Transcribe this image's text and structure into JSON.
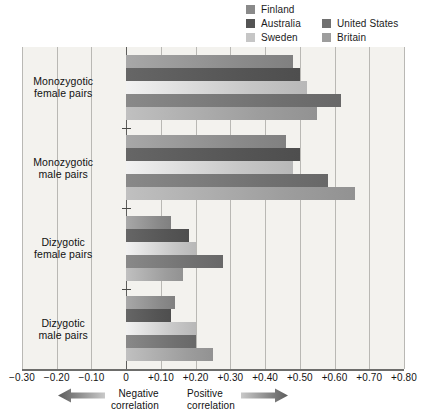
{
  "legend": {
    "columns": [
      [
        {
          "label": "Finland",
          "swatch": "#8a8a8a"
        },
        {
          "label": "Australia",
          "swatch": "#545454"
        },
        {
          "label": "Sweden",
          "swatch": "#c6c6c6"
        }
      ],
      [
        {
          "label": "United States",
          "swatch": "#707070"
        },
        {
          "label": "Britain",
          "swatch": "#9d9d9d"
        }
      ]
    ]
  },
  "axis": {
    "ticks": [
      {
        "label": "−0.30",
        "value": -0.3
      },
      {
        "label": "−0.20",
        "value": -0.2
      },
      {
        "label": "−0.10",
        "value": -0.1
      },
      {
        "label": "0",
        "value": 0.0
      },
      {
        "label": "+0.10",
        "value": 0.1
      },
      {
        "label": "+0.20",
        "value": 0.2
      },
      {
        "label": "+0.30",
        "value": 0.3
      },
      {
        "label": "+0.40",
        "value": 0.4
      },
      {
        "label": "+0.50",
        "value": 0.5
      },
      {
        "label": "+0.60",
        "value": 0.6
      },
      {
        "label": "+0.70",
        "value": 0.7
      },
      {
        "label": "+0.80",
        "value": 0.8
      }
    ],
    "min": -0.3,
    "max": 0.8
  },
  "captions": {
    "negative": {
      "line1": "Negative",
      "line2": "correlation",
      "arrow": "arrow-left-icon"
    },
    "positive": {
      "line1": "Positive",
      "line2": "correlation",
      "arrow": "arrow-right-icon"
    }
  },
  "chart_data": {
    "type": "bar",
    "orientation": "horizontal",
    "title": "",
    "xlabel": "",
    "ylabel": "",
    "xlim": [
      -0.3,
      0.8
    ],
    "grid": true,
    "legend_position": "top-right",
    "categories": [
      "Monozygotic female pairs",
      "Monozygotic male pairs",
      "Dizygotic female pairs",
      "Dizygotic male pairs"
    ],
    "series": [
      {
        "name": "Finland",
        "color": "#8a8a8a",
        "values": [
          0.48,
          0.46,
          0.13,
          0.14
        ]
      },
      {
        "name": "Australia",
        "color": "#545454",
        "values": [
          0.5,
          0.5,
          0.18,
          0.13
        ]
      },
      {
        "name": "Sweden",
        "color": "#c6c6c6",
        "values": [
          0.52,
          0.48,
          0.2,
          0.2
        ]
      },
      {
        "name": "United States",
        "color": "#707070",
        "values": [
          0.62,
          0.58,
          0.28,
          0.2
        ]
      },
      {
        "name": "Britain",
        "color": "#9d9d9d",
        "values": [
          0.55,
          0.66,
          0.165,
          0.25
        ]
      }
    ],
    "categories_short": [
      "MZ female",
      "MZ male",
      "DZ female",
      "DZ male"
    ]
  }
}
